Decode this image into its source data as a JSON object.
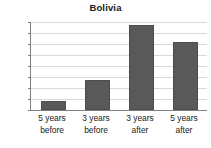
{
  "chart_data": {
    "type": "bar",
    "title": "Bolivia",
    "xlabel": "",
    "ylabel": "",
    "categories": [
      "5 years before",
      "3 years before",
      "3 years after",
      "5 years after"
    ],
    "category_lines": [
      [
        "5 years",
        "before"
      ],
      [
        "3 years",
        "before"
      ],
      [
        "3 years",
        "after"
      ],
      [
        "5 years",
        "after"
      ]
    ],
    "values": [
      50.8,
      52.75,
      57.7,
      56.2
    ],
    "ylim": [
      50,
      58
    ],
    "yticks": [
      50,
      51,
      52,
      53,
      54,
      55,
      56,
      57,
      58
    ],
    "ytick_labels": [
      "50",
      "51",
      "52",
      "53",
      "54",
      "55",
      "56",
      "57",
      "58"
    ],
    "grid": true,
    "legend": false,
    "bar_color": "#595959",
    "grid_color": "#d9d9d9",
    "axis_color": "#808080",
    "text_color": "#1a1a1a",
    "background": "#ffffff"
  }
}
